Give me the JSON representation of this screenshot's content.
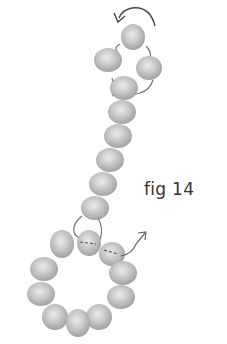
{
  "figure": {
    "label": "fig 14"
  },
  "colors": {
    "bead": "#b5b5b5",
    "bead_highlight": "#e8e8e8",
    "thread": "#777777",
    "arrow": "#555555"
  }
}
